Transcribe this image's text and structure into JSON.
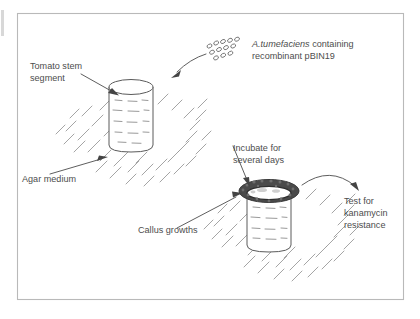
{
  "figure": {
    "background_color": "#ffffff",
    "frame_color": "#b9b9b9",
    "ink_color": "#555555",
    "label_color": "#4d4d4d",
    "callus_color": "#4a4a4a"
  },
  "labels": {
    "tomato_stem_line1": "Tomato stem",
    "tomato_stem_line2": "segment",
    "bacteria_line1_italic": "A.tumefaciens",
    "bacteria_line1_rest": " containing",
    "bacteria_line2": "recombinant pBIN19",
    "agar_medium": "Agar medium",
    "incubate_line1": "Incubate for",
    "incubate_line2": "several days",
    "callus_growths": "Callus growths",
    "test_line1": "Test for",
    "test_line2": "kanamycin",
    "test_line3": "resistance"
  },
  "elements": {
    "stem_cylinder_top": "tomato-stem-segment-cylinder",
    "stem_cylinder_bottom": "callus-stem-segment-cylinder",
    "agar_patch_top": "agar-medium-patch-upper",
    "agar_patch_bottom": "agar-medium-patch-lower",
    "bacteria_cloud": "agrobacterium-cells-cluster",
    "callus_ring": "callus-growth-ring"
  },
  "bacteria": {
    "count": 12,
    "positions": [
      {
        "x": 209.5,
        "y": 46.0,
        "r": 1.9
      },
      {
        "x": 215.8,
        "y": 43.2,
        "r": 1.9
      },
      {
        "x": 222.6,
        "y": 41.7,
        "r": 1.9
      },
      {
        "x": 229.4,
        "y": 40.6,
        "r": 1.9
      },
      {
        "x": 236.2,
        "y": 39.5,
        "r": 1.9
      },
      {
        "x": 212.3,
        "y": 52.1,
        "r": 1.9
      },
      {
        "x": 219.2,
        "y": 49.6,
        "r": 1.9
      },
      {
        "x": 226.0,
        "y": 47.8,
        "r": 1.9
      },
      {
        "x": 233.0,
        "y": 46.2,
        "r": 1.9
      },
      {
        "x": 216.0,
        "y": 57.8,
        "r": 1.9
      },
      {
        "x": 223.0,
        "y": 55.4,
        "r": 1.9
      },
      {
        "x": 230.2,
        "y": 53.4,
        "r": 1.9
      }
    ]
  }
}
